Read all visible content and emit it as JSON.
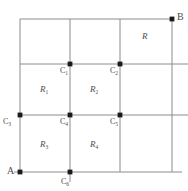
{
  "figure": {
    "type": "grid-diagram",
    "width": 188,
    "height": 191,
    "line_color": "#8c8c8c",
    "text_color": "#4d4d4d",
    "background": "#ffffff",
    "corners": [
      {
        "name": "A",
        "label": "A",
        "x": 20,
        "y": 172,
        "dot": true
      },
      {
        "name": "B",
        "label": "B",
        "x": 172,
        "y": 19,
        "dot": true
      }
    ],
    "nodes": [
      {
        "name": "C1",
        "letter": "C",
        "sub": "1",
        "x": 70,
        "y": 64,
        "dot": true
      },
      {
        "name": "C2",
        "letter": "C",
        "sub": "2",
        "x": 120,
        "y": 64,
        "dot": true
      },
      {
        "name": "C3",
        "letter": "C",
        "sub": "3",
        "x": 20,
        "y": 115,
        "dot": true
      },
      {
        "name": "C4",
        "letter": "C",
        "sub": "4",
        "x": 70,
        "y": 115,
        "dot": true
      },
      {
        "name": "C5",
        "letter": "C",
        "sub": "5",
        "x": 120,
        "y": 115,
        "dot": true
      },
      {
        "name": "C6",
        "letter": "C",
        "sub": "6",
        "x": 70,
        "y": 172,
        "dot": true
      }
    ],
    "regions": [
      {
        "name": "R",
        "letter": "R",
        "sub": "",
        "x": 146,
        "y": 36
      },
      {
        "name": "R1",
        "letter": "R",
        "sub": "1",
        "x": 45,
        "y": 89
      },
      {
        "name": "R2",
        "letter": "R",
        "sub": "2",
        "x": 95,
        "y": 89
      },
      {
        "name": "R3",
        "letter": "R",
        "sub": "3",
        "x": 45,
        "y": 144
      },
      {
        "name": "R4",
        "letter": "R",
        "sub": "4",
        "x": 95,
        "y": 144
      }
    ]
  }
}
